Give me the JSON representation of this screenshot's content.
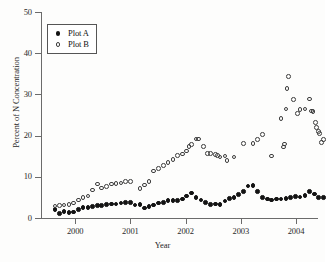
{
  "chart_data": {
    "type": "scatter",
    "title": "",
    "xlabel": "Year",
    "ylabel": "Percent of N Concentration",
    "xlim": [
      1999.38,
      2004.38
    ],
    "ylim": [
      0,
      50
    ],
    "yticks": [
      0,
      10,
      20,
      30,
      40,
      50
    ],
    "xticks": [
      2000,
      2001,
      2002,
      2003,
      2004
    ],
    "xtick_labels": [
      "2000",
      "2001",
      "2002",
      "2003",
      "2004"
    ],
    "ytick_labels": [
      "0",
      "10",
      "20",
      "30",
      "40",
      "50"
    ],
    "grid": false,
    "legend_position": "upper left",
    "series": [
      {
        "name": "Plot A",
        "marker": "filled-circle",
        "color": "#131313",
        "points": [
          [
            1999.63,
            2.0
          ],
          [
            1999.72,
            1.1
          ],
          [
            1999.8,
            1.6
          ],
          [
            1999.89,
            1.4
          ],
          [
            1999.97,
            1.5
          ],
          [
            2000.06,
            2.1
          ],
          [
            2000.14,
            2.6
          ],
          [
            2000.23,
            2.6
          ],
          [
            2000.31,
            2.8
          ],
          [
            2000.4,
            3.0
          ],
          [
            2000.48,
            3.0
          ],
          [
            2000.57,
            3.3
          ],
          [
            2000.66,
            3.4
          ],
          [
            2000.74,
            3.4
          ],
          [
            2000.83,
            3.6
          ],
          [
            2000.91,
            3.8
          ],
          [
            2001.0,
            3.8
          ],
          [
            2001.08,
            3.2
          ],
          [
            2001.17,
            3.3
          ],
          [
            2001.25,
            2.4
          ],
          [
            2001.34,
            2.8
          ],
          [
            2001.42,
            3.2
          ],
          [
            2001.51,
            3.6
          ],
          [
            2001.6,
            3.7
          ],
          [
            2001.68,
            4.2
          ],
          [
            2001.77,
            4.3
          ],
          [
            2001.85,
            4.3
          ],
          [
            2001.94,
            4.6
          ],
          [
            2002.02,
            5.3
          ],
          [
            2002.11,
            6.1
          ],
          [
            2002.19,
            5.0
          ],
          [
            2002.28,
            4.4
          ],
          [
            2002.36,
            3.8
          ],
          [
            2002.45,
            3.3
          ],
          [
            2002.54,
            3.4
          ],
          [
            2002.62,
            3.3
          ],
          [
            2002.71,
            4.1
          ],
          [
            2002.79,
            4.8
          ],
          [
            2002.88,
            5.0
          ],
          [
            2002.96,
            5.7
          ],
          [
            2003.05,
            6.5
          ],
          [
            2003.13,
            7.8
          ],
          [
            2003.22,
            7.9
          ],
          [
            2003.3,
            6.5
          ],
          [
            2003.39,
            5.0
          ],
          [
            2003.48,
            4.6
          ],
          [
            2003.56,
            4.4
          ],
          [
            2003.65,
            4.6
          ],
          [
            2003.73,
            4.6
          ],
          [
            2003.82,
            4.7
          ],
          [
            2003.9,
            5.0
          ],
          [
            2003.99,
            5.2
          ],
          [
            2004.07,
            5.1
          ],
          [
            2004.16,
            5.5
          ],
          [
            2004.24,
            6.5
          ],
          [
            2004.33,
            5.8
          ],
          [
            2004.41,
            5.0
          ],
          [
            2004.5,
            5.0
          ]
        ]
      },
      {
        "name": "Plot B",
        "marker": "open-circle",
        "color": "#3d3d3d",
        "points": [
          [
            1999.63,
            2.9
          ],
          [
            1999.72,
            3.0
          ],
          [
            1999.8,
            3.2
          ],
          [
            1999.89,
            3.3
          ],
          [
            1999.97,
            3.6
          ],
          [
            2000.06,
            4.4
          ],
          [
            2000.14,
            5.0
          ],
          [
            2000.23,
            5.3
          ],
          [
            2000.31,
            6.8
          ],
          [
            2000.4,
            8.3
          ],
          [
            2000.48,
            7.3
          ],
          [
            2000.57,
            7.6
          ],
          [
            2000.66,
            8.3
          ],
          [
            2000.74,
            8.4
          ],
          [
            2000.83,
            8.5
          ],
          [
            2000.91,
            8.9
          ],
          [
            2001.0,
            8.9
          ],
          [
            2001.17,
            7.1
          ],
          [
            2001.25,
            8.0
          ],
          [
            2001.34,
            8.8
          ],
          [
            2001.42,
            11.4
          ],
          [
            2001.51,
            12.0
          ],
          [
            2001.6,
            12.7
          ],
          [
            2001.68,
            13.4
          ],
          [
            2001.77,
            14.2
          ],
          [
            2001.85,
            15.2
          ],
          [
            2001.94,
            15.5
          ],
          [
            2002.02,
            16.3
          ],
          [
            2002.06,
            17.3
          ],
          [
            2002.11,
            17.8
          ],
          [
            2002.19,
            19.2
          ],
          [
            2002.23,
            19.2
          ],
          [
            2002.32,
            17.3
          ],
          [
            2002.4,
            15.7
          ],
          [
            2002.45,
            15.6
          ],
          [
            2002.54,
            15.4
          ],
          [
            2002.58,
            15.2
          ],
          [
            2002.62,
            14.8
          ],
          [
            2002.71,
            15.0
          ],
          [
            2002.75,
            14.0
          ],
          [
            2002.88,
            14.8
          ],
          [
            2003.05,
            18.1
          ],
          [
            2003.22,
            18.1
          ],
          [
            2003.3,
            19.0
          ],
          [
            2003.39,
            20.2
          ],
          [
            2003.56,
            15.0
          ],
          [
            2003.73,
            24.1
          ],
          [
            2003.77,
            17.2
          ],
          [
            2003.79,
            18.0
          ],
          [
            2003.82,
            26.5
          ],
          [
            2003.84,
            31.5
          ],
          [
            2003.86,
            34.4
          ],
          [
            2003.95,
            28.7
          ],
          [
            2004.03,
            25.3
          ],
          [
            2004.07,
            26.3
          ],
          [
            2004.16,
            26.5
          ],
          [
            2004.24,
            28.9
          ],
          [
            2004.28,
            26.0
          ],
          [
            2004.31,
            25.8
          ],
          [
            2004.35,
            23.2
          ],
          [
            2004.37,
            22.0
          ],
          [
            2004.41,
            21.0
          ],
          [
            2004.43,
            20.5
          ],
          [
            2004.46,
            18.3
          ],
          [
            2004.5,
            19.1
          ]
        ]
      }
    ]
  },
  "legend": {
    "items": [
      {
        "label": "Plot A"
      },
      {
        "label": "Plot B"
      }
    ]
  }
}
